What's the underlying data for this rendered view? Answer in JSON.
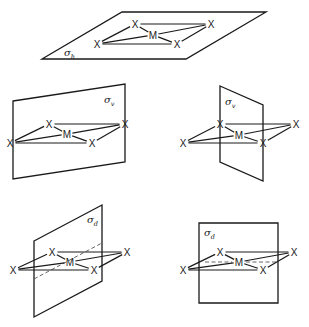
{
  "figure": {
    "atom_labels": {
      "central": "M",
      "ligand": "X"
    },
    "panels": [
      {
        "id": "sigma-h",
        "label": {
          "symbol": "σ",
          "subscript": "h"
        },
        "plane": {
          "points": "42,59 122,12 266,12 186,59"
        },
        "label_pos": {
          "x": 64,
          "y": 56
        },
        "atoms": {
          "X1": {
            "x": 97,
            "y": 44
          },
          "X2": {
            "x": 135,
            "y": 24
          },
          "M": {
            "x": 153,
            "y": 35
          },
          "X3": {
            "x": 211,
            "y": 24
          },
          "X4": {
            "x": 177,
            "y": 44
          }
        },
        "dashed": []
      },
      {
        "id": "sigma-v-1",
        "label": {
          "symbol": "σ",
          "subscript": "v"
        },
        "plane": {
          "points": "13,101 125,84 125,162 13,179"
        },
        "label_pos": {
          "x": 104,
          "y": 103
        },
        "atoms": {
          "X1": {
            "x": 10,
            "y": 143
          },
          "X2": {
            "x": 49,
            "y": 124
          },
          "M": {
            "x": 67,
            "y": 134
          },
          "X3": {
            "x": 125,
            "y": 124
          },
          "X4": {
            "x": 92,
            "y": 143
          }
        },
        "dashed": []
      },
      {
        "id": "sigma-v-2",
        "label": {
          "symbol": "σ",
          "subscript": "v"
        },
        "plane": {
          "points": "220,86 263,105 263,181 220,162"
        },
        "label_pos": {
          "x": 225,
          "y": 105
        },
        "atoms": {
          "X1": {
            "x": 183,
            "y": 143
          },
          "X2": {
            "x": 220,
            "y": 124
          },
          "M": {
            "x": 239,
            "y": 135
          },
          "X3": {
            "x": 296,
            "y": 124
          },
          "X4": {
            "x": 263,
            "y": 143
          }
        },
        "dashed": []
      },
      {
        "id": "sigma-d-1",
        "label": {
          "symbol": "σ",
          "subscript": "d"
        },
        "plane": {
          "points": "34,241 102,205 102,281 34,317"
        },
        "label_pos": {
          "x": 87,
          "y": 223
        },
        "atoms": {
          "X1": {
            "x": 13,
            "y": 270
          },
          "X2": {
            "x": 52,
            "y": 252
          },
          "M": {
            "x": 70,
            "y": 262
          },
          "X3": {
            "x": 127,
            "y": 252
          },
          "X4": {
            "x": 94,
            "y": 270
          }
        },
        "dashed": [
          {
            "x1": 34,
            "y1": 279,
            "x2": 102,
            "y2": 243
          }
        ]
      },
      {
        "id": "sigma-d-2",
        "label": {
          "symbol": "σ",
          "subscript": "d"
        },
        "plane": {
          "points": "199,223 278,223 278,303 199,303"
        },
        "label_pos": {
          "x": 204,
          "y": 236
        },
        "atoms": {
          "X1": {
            "x": 183,
            "y": 270
          },
          "X2": {
            "x": 220,
            "y": 252
          },
          "M": {
            "x": 239,
            "y": 262
          },
          "X3": {
            "x": 294,
            "y": 252
          },
          "X4": {
            "x": 263,
            "y": 270
          }
        },
        "dashed": [
          {
            "x1": 205,
            "y1": 262,
            "x2": 232,
            "y2": 262
          },
          {
            "x1": 246,
            "y1": 262,
            "x2": 278,
            "y2": 262
          }
        ]
      }
    ]
  }
}
